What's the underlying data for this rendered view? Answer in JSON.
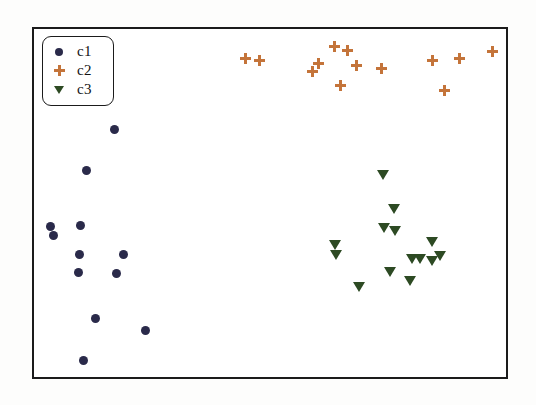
{
  "chart_data": {
    "type": "scatter",
    "title": "",
    "xlabel": "",
    "ylabel": "",
    "grid": false,
    "xlim": [
      0,
      100
    ],
    "ylim": [
      0,
      100
    ],
    "axis_ticks": {
      "x": [],
      "y": []
    },
    "legend": {
      "position": "top-left",
      "entries": [
        {
          "label": "c1",
          "marker": "circle",
          "color": "#2a2a4a"
        },
        {
          "label": "c2",
          "marker": "plus",
          "color": "#c4743a"
        },
        {
          "label": "c3",
          "marker": "triangle-down",
          "color": "#2d4a23"
        }
      ]
    },
    "series": [
      {
        "name": "c1",
        "marker": "circle",
        "color": "#2a2a4a",
        "points": [
          {
            "x": 17.4,
            "y": 71.4
          },
          {
            "x": 11.5,
            "y": 59.7
          },
          {
            "x": 3.9,
            "y": 43.8
          },
          {
            "x": 4.5,
            "y": 41.2
          },
          {
            "x": 10.2,
            "y": 44.0
          },
          {
            "x": 10.0,
            "y": 35.8
          },
          {
            "x": 19.3,
            "y": 35.8
          },
          {
            "x": 9.8,
            "y": 30.7
          },
          {
            "x": 17.7,
            "y": 30.4
          },
          {
            "x": 13.3,
            "y": 17.6
          },
          {
            "x": 23.8,
            "y": 14.2
          },
          {
            "x": 10.8,
            "y": 5.7
          }
        ]
      },
      {
        "name": "c2",
        "marker": "plus",
        "color": "#c4743a",
        "points": [
          {
            "x": 44.7,
            "y": 91.2
          },
          {
            "x": 47.7,
            "y": 90.6
          },
          {
            "x": 60.1,
            "y": 94.6
          },
          {
            "x": 58.8,
            "y": 92.3
          },
          {
            "x": 63.4,
            "y": 99.4
          },
          {
            "x": 66.2,
            "y": 98.3
          },
          {
            "x": 68.1,
            "y": 94.0
          },
          {
            "x": 64.7,
            "y": 88.4
          },
          {
            "x": 73.3,
            "y": 93.2
          },
          {
            "x": 84.0,
            "y": 95.5
          },
          {
            "x": 89.7,
            "y": 96.0
          },
          {
            "x": 96.6,
            "y": 98.3
          },
          {
            "x": 86.6,
            "y": 87.2
          }
        ]
      },
      {
        "name": "c3",
        "marker": "triangle-down",
        "color": "#2d4a23",
        "points": [
          {
            "x": 73.7,
            "y": 57.1
          },
          {
            "x": 76.1,
            "y": 47.4
          },
          {
            "x": 73.9,
            "y": 42.0
          },
          {
            "x": 76.3,
            "y": 41.2
          },
          {
            "x": 63.7,
            "y": 37.2
          },
          {
            "x": 63.9,
            "y": 34.4
          },
          {
            "x": 84.0,
            "y": 38.6
          },
          {
            "x": 74.4,
            "y": 33.8
          },
          {
            "x": 76.1,
            "y": 33.8
          },
          {
            "x": 84.0,
            "y": 33.2
          },
          {
            "x": 68.7,
            "y": 25.9
          },
          {
            "x": 78.4,
            "y": 27.3
          },
          {
            "x": 74.2,
            "y": 25.0
          },
          {
            "x": 86.1,
            "y": 36.4
          }
        ]
      }
    ]
  },
  "plot": {
    "points": {
      "c1": [
        [
          114,
          129
        ],
        [
          86,
          170
        ],
        [
          50,
          226
        ],
        [
          53,
          235
        ],
        [
          80,
          225
        ],
        [
          79,
          254
        ],
        [
          123,
          254
        ],
        [
          78,
          272
        ],
        [
          116,
          273
        ],
        [
          95,
          318
        ],
        [
          145,
          330
        ],
        [
          83,
          360
        ]
      ],
      "c2": [
        [
          245,
          58
        ],
        [
          259,
          60
        ],
        [
          318,
          63
        ],
        [
          312,
          71
        ],
        [
          334,
          46
        ],
        [
          347,
          50
        ],
        [
          356,
          65
        ],
        [
          340,
          85
        ],
        [
          381,
          68
        ],
        [
          432,
          60
        ],
        [
          459,
          58
        ],
        [
          492,
          51
        ],
        [
          444,
          90
        ]
      ],
      "c3": [
        [
          383,
          175
        ],
        [
          394,
          209
        ],
        [
          384,
          228
        ],
        [
          395,
          231
        ],
        [
          335,
          245
        ],
        [
          336,
          255
        ],
        [
          432,
          242
        ],
        [
          412,
          259
        ],
        [
          420,
          259
        ],
        [
          432,
          261
        ],
        [
          359,
          287
        ],
        [
          390,
          272
        ],
        [
          410,
          281
        ],
        [
          440,
          256
        ]
      ]
    }
  }
}
